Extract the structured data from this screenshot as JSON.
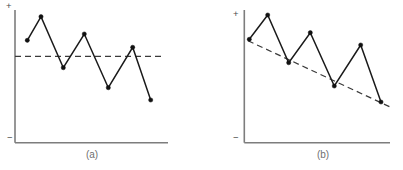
{
  "figure": {
    "background_color": "#ffffff",
    "line_color": "#1a1a1a",
    "axis_color": "#7d7d7d",
    "trend_color": "#3a3a3a",
    "marker_color": "#111111",
    "caption_color": "#6f6f6f"
  },
  "chart_data": [
    {
      "type": "line",
      "id": "panel-a",
      "title": "(a)",
      "caption": "(a)",
      "xlabel": "",
      "ylabel": "",
      "axis_top_label": "+",
      "axis_bottom_label": "−",
      "grid": false,
      "legend": "none",
      "xlim": [
        0,
        10
      ],
      "ylim": [
        -1,
        1
      ],
      "x": [
        1,
        2,
        3,
        4,
        5,
        6,
        7
      ],
      "values": [
        0.62,
        0.93,
        0.32,
        0.73,
        0.1,
        0.54,
        -0.07
      ],
      "series": [
        {
          "name": "observed",
          "values": [
            0.62,
            0.93,
            0.32,
            0.73,
            0.1,
            0.54,
            -0.07
          ]
        }
      ],
      "trend": {
        "name": "trend",
        "style": "dashed",
        "slope": 0,
        "x": [
          0,
          10
        ],
        "values": [
          0.41,
          0.41
        ],
        "description": "flat horizontal dashed reference line"
      },
      "pixel_geometry": {
        "axis_x": 15,
        "axis_y": 142.7,
        "axis_top_y": 10,
        "axis_right_x": 168,
        "plus_label_xy": [
          6,
          9
        ],
        "minus_label_xy": [
          7,
          141
        ],
        "caption_xy": [
          92,
          158
        ],
        "points": [
          [
            27.3,
            40.3
          ],
          [
            41.0,
            16.7
          ],
          [
            63.3,
            67.7
          ],
          [
            84.3,
            34.0
          ],
          [
            108.3,
            87.7
          ],
          [
            132.7,
            47.3
          ],
          [
            150.7,
            100.0
          ]
        ],
        "trend_points": [
          [
            15,
            56.3
          ],
          [
            162,
            56.3
          ]
        ]
      }
    },
    {
      "type": "line",
      "id": "panel-b",
      "title": "(b)",
      "caption": "(b)",
      "xlabel": "",
      "ylabel": "",
      "axis_top_label": "+",
      "axis_bottom_label": "−",
      "grid": false,
      "legend": "none",
      "xlim": [
        0,
        10
      ],
      "ylim": [
        -1,
        1
      ],
      "x": [
        1,
        2,
        3,
        4,
        5,
        6,
        7
      ],
      "values": [
        0.63,
        0.94,
        0.58,
        0.82,
        0.36,
        0.69,
        0.13
      ],
      "series": [
        {
          "name": "observed",
          "values": [
            0.63,
            0.94,
            0.58,
            0.82,
            0.36,
            0.69,
            0.13
          ]
        }
      ],
      "trend": {
        "name": "trend",
        "style": "dashed",
        "slope": -0.46,
        "x": [
          0.2,
          9.8
        ],
        "values": [
          0.62,
          0.1
        ],
        "description": "downward sloping dashed trend line"
      },
      "pixel_geometry": {
        "axis_x": 244.3,
        "axis_y": 142.7,
        "axis_top_y": 10,
        "axis_right_x": 390,
        "plus_label_xy": [
          233,
          17
        ],
        "minus_label_xy": [
          233,
          141
        ],
        "caption_xy": [
          323,
          158
        ],
        "points": [
          [
            249.3,
            39.3
          ],
          [
            267.7,
            15.0
          ],
          [
            288.7,
            62.7
          ],
          [
            310.3,
            32.7
          ],
          [
            334.3,
            86.0
          ],
          [
            360.7,
            45.0
          ],
          [
            381.0,
            102.0
          ]
        ],
        "trend_points": [
          [
            248.0,
            40.7
          ],
          [
            393.0,
            108.3
          ]
        ]
      }
    }
  ]
}
